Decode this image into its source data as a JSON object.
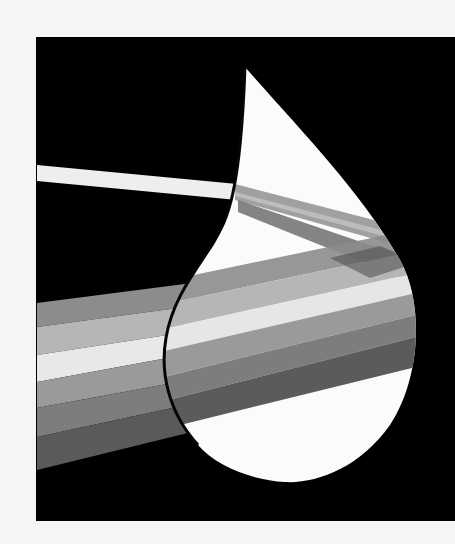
{
  "artwork": {
    "subject": "water drop refracting a white light beam into a spectrum of bands",
    "palette": {
      "background": "#f5f5f3",
      "panel": "#000000",
      "drop": "#fbfbfb",
      "outline": "#050505",
      "beam": "#efefef"
    },
    "bands_left": [
      "#8a8a8a",
      "#b4b4b4",
      "#e9e9e9",
      "#9a9a9a",
      "#7c7c7c",
      "#5a5a5a"
    ],
    "bands_inner": [
      "#9d9d9d",
      "#c4c4c4",
      "#a9a9a9",
      "#7a7a7a",
      "#5e5e5e"
    ]
  }
}
